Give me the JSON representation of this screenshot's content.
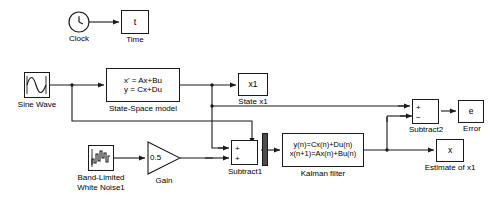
{
  "diagram": {
    "background": "#ffffff",
    "line_color": "#1a1a1a",
    "mux_color": "#4d4d4d",
    "width": 498,
    "height": 199
  },
  "blocks": {
    "clock": {
      "label": "Clock",
      "icon": "clock-icon"
    },
    "time": {
      "value": "t",
      "label": "Time"
    },
    "sine_wave": {
      "label": "Sine Wave",
      "icon": "sine-wave-icon"
    },
    "state_space": {
      "eq1": "x' = Ax+Bu",
      "eq2": "y = Cx+Du",
      "label": "State-Space model"
    },
    "state_x1": {
      "value": "x1",
      "label": "State x1"
    },
    "white_noise": {
      "label_line1": "Band-Limited",
      "label_line2": "White Noise1",
      "icon": "random-noise-icon"
    },
    "gain": {
      "value": "0.5",
      "label": "Gain",
      "shape": "triangle"
    },
    "subtract1": {
      "label": "Subtract1",
      "sign_top": "+",
      "sign_bottom": "+"
    },
    "mux": {
      "label": "",
      "icon": "mux-bar"
    },
    "kalman_filter": {
      "eq1": "y(n)=Cx(n)+Du(n)",
      "eq2": "x(n+1)=Ax(n)+Bu(n)",
      "label": "Kalman filter"
    },
    "estimate_x1": {
      "value": "x",
      "label": "Estimate of x1"
    },
    "subtract2": {
      "label": "Subtract2",
      "sign_top": "+",
      "sign_bottom": "−"
    },
    "error": {
      "value": "e",
      "label": "Error"
    }
  }
}
